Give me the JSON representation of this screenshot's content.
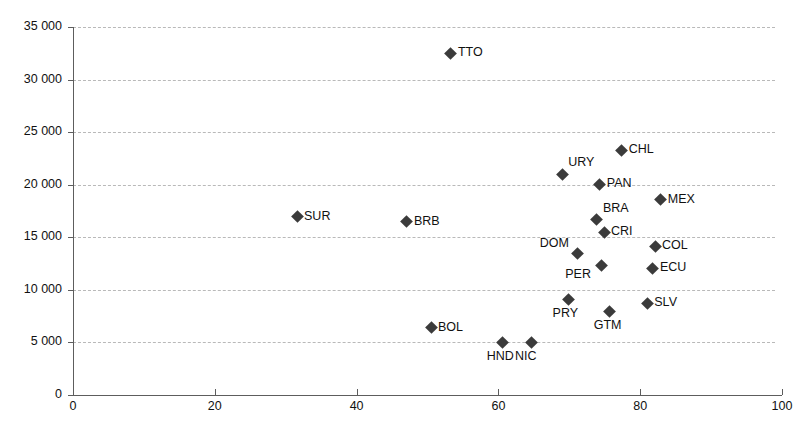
{
  "chart_data": {
    "type": "scatter",
    "title": "",
    "xlabel": "",
    "ylabel": "",
    "xlim": [
      0,
      100
    ],
    "ylim": [
      0,
      35000
    ],
    "grid": true,
    "legend": "none",
    "marker_shape": "diamond",
    "marker_color": "#3b3b3b",
    "gridline_color": "#b9b9b9",
    "axis_color": "#5d5d5d",
    "xticks": [
      0,
      20,
      40,
      60,
      80,
      100
    ],
    "xtick_labels": [
      "0",
      "20",
      "40",
      "60",
      "80",
      "100"
    ],
    "yticks": [
      0,
      5000,
      10000,
      15000,
      20000,
      25000,
      30000,
      35000
    ],
    "ytick_labels": [
      "0",
      "5 000",
      "10 000",
      "15 000",
      "20 000",
      "25 000",
      "30 000",
      "35 000"
    ],
    "points": [
      {
        "label": "TTO",
        "x": 53.3,
        "y": 32500,
        "label_pos": "right"
      },
      {
        "label": "CHL",
        "x": 77.4,
        "y": 23300,
        "label_pos": "right"
      },
      {
        "label": "URY",
        "x": 69.0,
        "y": 21000,
        "label_pos": "above-right"
      },
      {
        "label": "PAN",
        "x": 74.3,
        "y": 20050,
        "label_pos": "right"
      },
      {
        "label": "MEX",
        "x": 82.9,
        "y": 18550,
        "label_pos": "right"
      },
      {
        "label": "SUR",
        "x": 31.6,
        "y": 16950,
        "label_pos": "right"
      },
      {
        "label": "BRB",
        "x": 47.1,
        "y": 16500,
        "label_pos": "right"
      },
      {
        "label": "BRA",
        "x": 73.9,
        "y": 16650,
        "label_pos": "above-right"
      },
      {
        "label": "CRI",
        "x": 74.9,
        "y": 15500,
        "label_pos": "right"
      },
      {
        "label": "COL",
        "x": 82.1,
        "y": 14150,
        "label_pos": "right"
      },
      {
        "label": "DOM",
        "x": 71.2,
        "y": 13500,
        "label_pos": "above-left"
      },
      {
        "label": "PER",
        "x": 74.5,
        "y": 12350,
        "label_pos": "below-left"
      },
      {
        "label": "ECU",
        "x": 81.8,
        "y": 12050,
        "label_pos": "right"
      },
      {
        "label": "PRY",
        "x": 69.9,
        "y": 9100,
        "label_pos": "below"
      },
      {
        "label": "SLV",
        "x": 81.0,
        "y": 8750,
        "label_pos": "right"
      },
      {
        "label": "GTM",
        "x": 75.7,
        "y": 7950,
        "label_pos": "below"
      },
      {
        "label": "BOL",
        "x": 50.5,
        "y": 6400,
        "label_pos": "right"
      },
      {
        "label": "HND",
        "x": 60.6,
        "y": 5000,
        "label_pos": "below"
      },
      {
        "label": "NIC",
        "x": 64.6,
        "y": 5000,
        "label_pos": "below"
      }
    ]
  }
}
